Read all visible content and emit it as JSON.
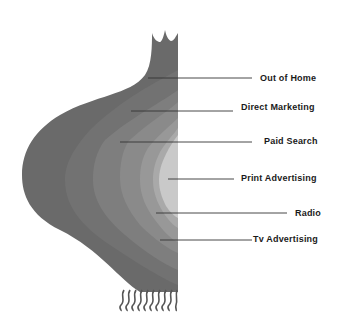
{
  "diagram": {
    "type": "onion-diagram",
    "layers": [
      {
        "label": "Out of Home",
        "color": "#6a6a6a",
        "line_y": 78,
        "line_x1": 148,
        "line_x2": 252,
        "label_x": 260
      },
      {
        "label": "Direct Marketing",
        "color": "#777777",
        "line_y": 111,
        "line_x1": 131,
        "line_x2": 233,
        "label_x": 241
      },
      {
        "label": "Paid Search",
        "color": "#848484",
        "line_y": 142,
        "line_x1": 120,
        "line_x2": 252,
        "label_x": 264
      },
      {
        "label": "Print Advertising",
        "color": "#c9c9c9",
        "line_y": 179,
        "line_x1": 168,
        "line_x2": 234,
        "label_x": 241
      },
      {
        "label": "Radio",
        "color": "#a9a9a9",
        "line_y": 213,
        "line_x1": 156,
        "line_x2": 287,
        "label_x": 295
      },
      {
        "label": "Tv Advertising",
        "color": "#959595",
        "line_y": 240,
        "line_x1": 160,
        "line_x2": 252,
        "label_x": 253
      }
    ],
    "leader_line_color": "#333333"
  }
}
